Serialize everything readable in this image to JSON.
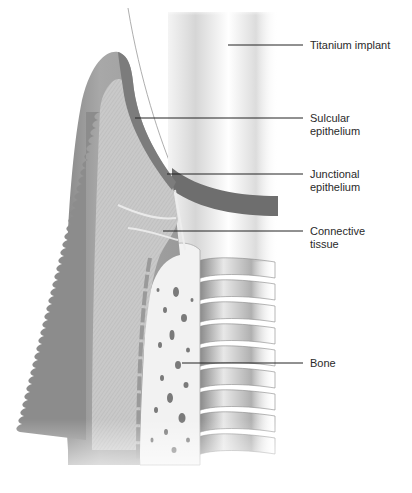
{
  "figure": {
    "labels": [
      {
        "id": "titanium-implant",
        "text": "Titanium implant",
        "x": 310,
        "y": 41
      },
      {
        "id": "sulcular-epithelium",
        "text": "Sulcular\nepithelium",
        "x": 310,
        "y": 113
      },
      {
        "id": "junctional-epithelium",
        "text": "Junctional\nepithelium",
        "x": 310,
        "y": 168
      },
      {
        "id": "connective-tissue",
        "text": "Connective\ntissue",
        "x": 310,
        "y": 224
      },
      {
        "id": "bone",
        "text": "Bone",
        "x": 310,
        "y": 359
      }
    ]
  }
}
